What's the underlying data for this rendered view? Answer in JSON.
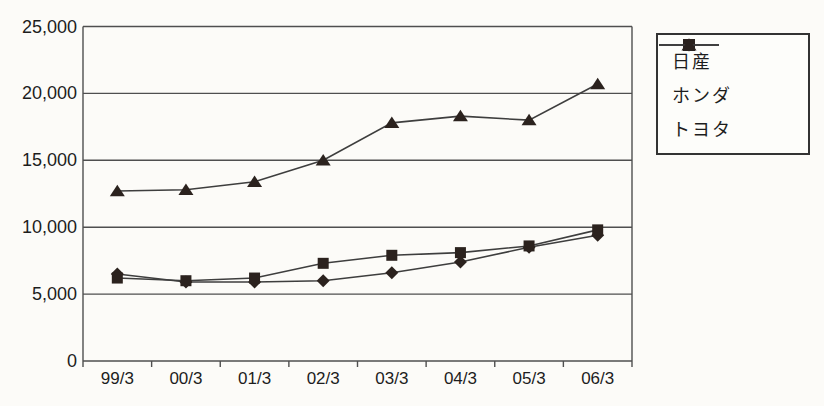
{
  "chart_data": {
    "type": "line",
    "title": "",
    "xlabel": "",
    "ylabel": "",
    "categories": [
      "99/3",
      "00/3",
      "01/3",
      "02/3",
      "03/3",
      "04/3",
      "05/3",
      "06/3"
    ],
    "series": [
      {
        "name": "日産",
        "marker": "diamond",
        "values": [
          6500,
          5900,
          5900,
          6000,
          6600,
          7400,
          8500,
          9400
        ]
      },
      {
        "name": "ホンダ",
        "marker": "square",
        "values": [
          6200,
          6000,
          6200,
          7300,
          7900,
          8100,
          8600,
          9800
        ]
      },
      {
        "name": "トヨタ",
        "marker": "triangle",
        "values": [
          12700,
          12800,
          13400,
          15000,
          17800,
          18300,
          18000,
          20700
        ]
      }
    ],
    "ylim": [
      0,
      25000
    ],
    "y_ticks": [
      0,
      5000,
      10000,
      15000,
      20000,
      25000
    ],
    "y_tick_labels": [
      "0",
      "5,000",
      "10,000",
      "15,000",
      "20,000",
      "25,000"
    ],
    "grid": "horizontal",
    "legend_position": "right"
  },
  "colors": {
    "background": "#fcfbf8",
    "grid": "#4f4f4f",
    "axis": "#4f4f4f",
    "series_line": "#3e3e3e",
    "marker_fill": "#2b221e",
    "text": "#1d1d1d",
    "legend_border": "#333333",
    "legend_background": "#fdfdfa"
  }
}
